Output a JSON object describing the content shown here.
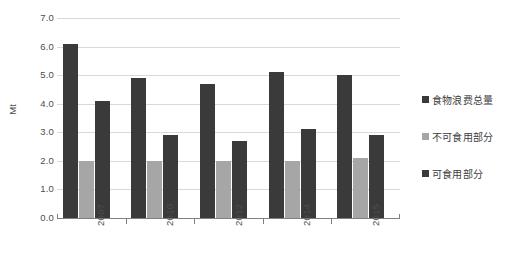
{
  "chart_data": {
    "type": "bar",
    "title": "",
    "subtitle": "",
    "xlabel": "",
    "ylabel": "Mt",
    "categories": [
      "2007",
      "2010",
      "2012",
      "2014",
      "2015"
    ],
    "series": [
      {
        "name": "食物浪费总量",
        "color": "#3a3a3a",
        "values": [
          6.1,
          4.9,
          4.7,
          5.1,
          5.0
        ]
      },
      {
        "name": "不可食用部分",
        "color": "#a6a6a6",
        "values": [
          2.0,
          2.0,
          2.0,
          2.0,
          2.1
        ]
      },
      {
        "name": "可食用部分",
        "color": "#3a3a3a",
        "values": [
          4.1,
          2.9,
          2.7,
          3.1,
          2.9
        ]
      }
    ],
    "ylim": [
      0.0,
      7.0
    ],
    "ytick_labels": [
      "0.0",
      "1.0",
      "2.0",
      "3.0",
      "4.0",
      "5.0",
      "6.0",
      "7.0"
    ],
    "ytick_values": [
      0.0,
      1.0,
      2.0,
      3.0,
      4.0,
      5.0,
      6.0,
      7.0
    ],
    "grid": true,
    "legend_position": "right"
  },
  "legend": {
    "items": [
      {
        "label": "食物浪费总量",
        "color": "#3a3a3a"
      },
      {
        "label": "不可食用部分",
        "color": "#a6a6a6"
      },
      {
        "label": "可食用部分",
        "color": "#3a3a3a"
      }
    ]
  },
  "axes": {
    "y_title": "Mt"
  },
  "colors": {
    "dark_bar": "#3a3a3a",
    "gray_bar": "#a6a6a6",
    "gridline": "#d9d9d9",
    "axis": "#7f7f7f",
    "text": "#4d4d4d",
    "background": "#ffffff"
  }
}
